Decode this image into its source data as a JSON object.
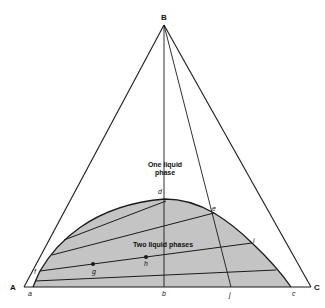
{
  "diagram": {
    "type": "ternary-phase-diagram",
    "vertices": {
      "A": "A",
      "B": "B",
      "C": "C"
    },
    "points": {
      "a": "a",
      "b": "b",
      "c": "c",
      "d": "d",
      "e": "e",
      "f": "f",
      "g": "g",
      "h": "h",
      "i": "i",
      "j": "j"
    },
    "regions": {
      "one_phase_line1": "One liquid",
      "one_phase_line2": "phase",
      "two_phase": "Two liquid phases"
    },
    "colors": {
      "line": "#1a1a1a",
      "two_phase_fill": "#c4c4c4",
      "background": "#ffffff"
    }
  }
}
